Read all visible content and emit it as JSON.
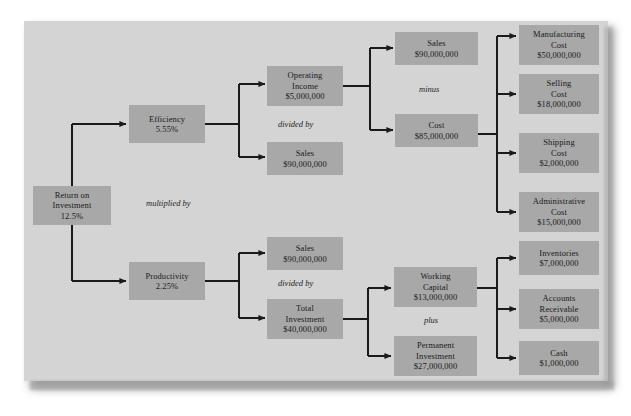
{
  "diagram": {
    "panel_color": "#d4d4d4",
    "node_color": "#a8a8a8",
    "line_color": "#1a1a1a",
    "nodes": {
      "roi": {
        "lines": [
          "Return on",
          "Investment",
          "12.5%"
        ]
      },
      "efficiency": {
        "lines": [
          "Efficiency",
          "5.55%"
        ]
      },
      "productivity": {
        "lines": [
          "Productivity",
          "2.25%"
        ]
      },
      "operating_income": {
        "lines": [
          "Operating",
          "Income",
          "$5,000,000"
        ]
      },
      "sales_eff": {
        "lines": [
          "Sales",
          "$90,000,000"
        ]
      },
      "sales_prod": {
        "lines": [
          "Sales",
          "$90,000,000"
        ]
      },
      "total_investment": {
        "lines": [
          "Total",
          "Investment",
          "$40,000,000"
        ]
      },
      "sales_top": {
        "lines": [
          "Sales",
          "$90,000,000"
        ]
      },
      "cost": {
        "lines": [
          "Cost",
          "$85,000,000"
        ]
      },
      "working_capital": {
        "lines": [
          "Working",
          "Capital",
          "$13,000,000"
        ]
      },
      "permanent_investment": {
        "lines": [
          "Permanent",
          "Investment",
          "$27,000,000"
        ]
      },
      "manufacturing_cost": {
        "lines": [
          "Manufacturing",
          "Cost",
          "$50,000,000"
        ]
      },
      "selling_cost": {
        "lines": [
          "Selling",
          "Cost",
          "$18,000,000"
        ]
      },
      "shipping_cost": {
        "lines": [
          "Shipping",
          "Cost",
          "$2,000,000"
        ]
      },
      "administrative_cost": {
        "lines": [
          "Administrative",
          "Cost",
          "$15,000,000"
        ]
      },
      "inventories": {
        "lines": [
          "Inventories",
          "$7,000,000"
        ]
      },
      "accounts_receivable": {
        "lines": [
          "Accounts",
          "Receivable",
          "$5,000,000"
        ]
      },
      "cash": {
        "lines": [
          "Cash",
          "$1,000,000"
        ]
      }
    },
    "operators": {
      "multiplied_by": "multiplied by",
      "divided_by_top": "divided by",
      "divided_by_bottom": "divided by",
      "minus": "minus",
      "plus": "plus"
    }
  }
}
